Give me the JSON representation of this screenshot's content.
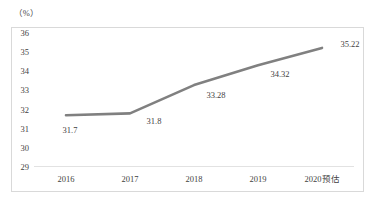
{
  "chart_data": {
    "type": "line",
    "title": "",
    "subtitle": "",
    "xlabel": "",
    "ylabel": "（%）",
    "unit_label": "（%）",
    "categories": [
      "2016",
      "2017",
      "2018",
      "2019",
      "2020预估"
    ],
    "values": [
      31.7,
      31.8,
      33.28,
      34.32,
      35.22
    ],
    "point_labels": [
      "31.7",
      "31.8",
      "33.28",
      "34.32",
      "35.22"
    ],
    "series": [
      {
        "name": "",
        "values": [
          31.7,
          31.8,
          33.28,
          34.32,
          35.22
        ],
        "color": "#808080"
      }
    ],
    "ylim": [
      29,
      36
    ],
    "yticks": [
      29,
      30,
      31,
      32,
      33,
      34,
      35,
      36
    ],
    "ytick_labels": [
      "29",
      "30",
      "31",
      "32",
      "33",
      "34",
      "35",
      "36"
    ],
    "grid": false,
    "legend": false,
    "legend_position": "none",
    "line_color": "#808080",
    "axis_color": "#e2e2e2",
    "frame_color": "#d9d9d9",
    "text_color": "#3f3f3f",
    "background": "#ffffff"
  }
}
